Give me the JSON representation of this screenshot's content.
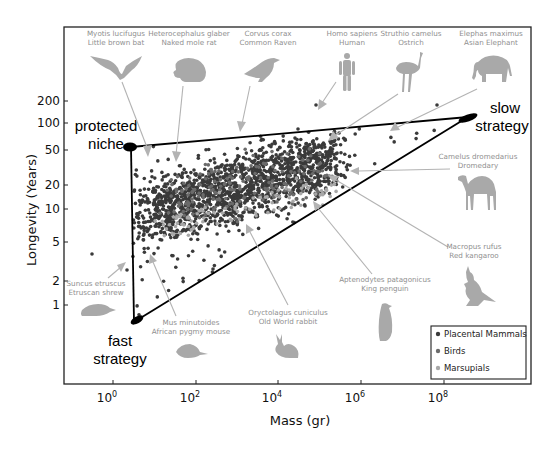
{
  "figure": {
    "xlabel": "Mass (gr)",
    "ylabel": "Longevity (Years)",
    "x_ticks": [
      {
        "base": "10",
        "exp": "0"
      },
      {
        "base": "10",
        "exp": "2"
      },
      {
        "base": "10",
        "exp": "4"
      },
      {
        "base": "10",
        "exp": "6"
      },
      {
        "base": "10",
        "exp": "8"
      }
    ],
    "y_ticks": [
      "200",
      "100",
      "50",
      "20",
      "10",
      "5",
      "2",
      "1"
    ],
    "strategies": {
      "protected_line1": "protected",
      "protected_line2": "niche",
      "fast_line1": "fast",
      "fast_line2": "strategy",
      "slow_line1": "slow",
      "slow_line2": "strategy"
    },
    "legend": [
      {
        "label": "Placental Mammals",
        "color": "#3a3a3a"
      },
      {
        "label": "Birds",
        "color": "#6b6b6b"
      },
      {
        "label": "Marsupials",
        "color": "#a8a8a8"
      }
    ],
    "species": [
      {
        "id": "bat",
        "latin": "Myotis lucifugus",
        "common": "Little brown bat"
      },
      {
        "id": "molerat",
        "latin": "Heterocephalus glaber",
        "common": "Naked mole rat"
      },
      {
        "id": "raven",
        "latin": "Corvus corax",
        "common": "Common Raven"
      },
      {
        "id": "human",
        "latin": "Homo sapiens",
        "common": "Human"
      },
      {
        "id": "ostrich",
        "latin": "Struthio camelus",
        "common": "Ostrich"
      },
      {
        "id": "elephant",
        "latin": "Elephas maximus",
        "common": "Asian Elephant"
      },
      {
        "id": "camel",
        "latin": "Camelus dromedarius",
        "common": "Dromedary"
      },
      {
        "id": "kangaroo",
        "latin": "Macropus rufus",
        "common": "Red kangaroo"
      },
      {
        "id": "penguin",
        "latin": "Aptenodytes patagonicus",
        "common": "King penguin"
      },
      {
        "id": "rabbit",
        "latin": "Oryctolagus cuniculus",
        "common": "Old World rabbit"
      },
      {
        "id": "pygmymouse",
        "latin": "Mus minutoides",
        "common": "African pygmy mouse"
      },
      {
        "id": "shrew",
        "latin": "Suncus etruscus",
        "common": "Etruscan shrew"
      }
    ]
  },
  "chart_data": {
    "type": "scatter",
    "title": "",
    "xlabel": "Mass (gr)",
    "ylabel": "Longevity (Years)",
    "x_scale": "log10",
    "y_scale": "log10",
    "xlim": [
      0.03,
      10000000000.0
    ],
    "ylim": [
      0.35,
      400
    ],
    "x_tick_labels": [
      "10^0",
      "10^2",
      "10^4",
      "10^6",
      "10^8"
    ],
    "y_tick_labels": [
      "1",
      "2",
      "5",
      "10",
      "20",
      "50",
      "100",
      "200"
    ],
    "grid": false,
    "legend_position": "lower right",
    "series": [
      {
        "name": "Placental Mammals",
        "color": "#3a3a3a",
        "approx_points": "~2000, dense cloud mass 10^0.5–10^6 g, longevity ~3–80 yr"
      },
      {
        "name": "Birds",
        "color": "#6b6b6b",
        "approx_points": "concentrated mass 10^1–10^5 g, longevity ~5–60 yr"
      },
      {
        "name": "Marsupials",
        "color": "#a8a8a8",
        "approx_points": "mass 10^1–10^5 g, longevity ~3–20 yr"
      }
    ],
    "envelope_triangle": {
      "protected_niche": {
        "mass_g": 3,
        "longevity_yr": 55
      },
      "fast_strategy": {
        "mass_g": 4,
        "longevity_yr": 0.6
      },
      "slow_strategy": {
        "mass_g": 100000000.0,
        "longevity_yr": 110
      }
    },
    "annotations": [
      {
        "text": "protected niche",
        "near": "upper-left vertex"
      },
      {
        "text": "fast strategy",
        "near": "lower-left vertex"
      },
      {
        "text": "slow strategy",
        "near": "right vertex"
      },
      {
        "text": "Myotis lucifugus / Little brown bat",
        "mass_g": 8,
        "longevity_yr": 34
      },
      {
        "text": "Heterocephalus glaber / Naked mole rat",
        "mass_g": 35,
        "longevity_yr": 31
      },
      {
        "text": "Corvus corax / Common Raven",
        "mass_g": 1200,
        "longevity_yr": 69
      },
      {
        "text": "Homo sapiens / Human",
        "mass_g": 70000,
        "longevity_yr": 122
      },
      {
        "text": "Struthio camelus / Ostrich",
        "mass_g": 110000,
        "longevity_yr": 50
      },
      {
        "text": "Elephas maximus / Asian Elephant",
        "mass_g": 3600000,
        "longevity_yr": 80
      },
      {
        "text": "Camelus dromedarius / Dromedary",
        "mass_g": 400000,
        "longevity_yr": 40
      },
      {
        "text": "Macropus rufus / Red kangaroo",
        "mass_g": 25000,
        "longevity_yr": 16
      },
      {
        "text": "Aptenodytes patagonicus / King penguin",
        "mass_g": 11000,
        "longevity_yr": 26
      },
      {
        "text": "Oryctolagus cuniculus / Old World rabbit",
        "mass_g": 1600,
        "longevity_yr": 9
      },
      {
        "text": "Mus minutoides / African pygmy mouse",
        "mass_g": 6,
        "longevity_yr": 3
      },
      {
        "text": "Suncus etruscus / Etruscan shrew",
        "mass_g": 1.8,
        "longevity_yr": 3.2
      }
    ]
  }
}
